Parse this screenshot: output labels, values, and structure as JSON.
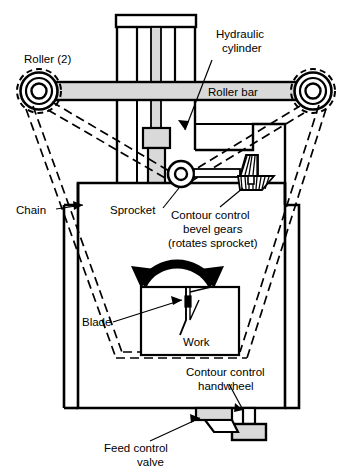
{
  "figure": {
    "type": "technical-line-diagram",
    "background_color": "#ffffff",
    "line_color": "#000000",
    "fill_gray": "#d9d9d9",
    "fill_white": "#ffffff"
  },
  "labels": {
    "roller": "Roller (2)",
    "hydraulic_cylinder_line1": "Hydraulic",
    "hydraulic_cylinder_line2": "cylinder",
    "roller_bar": "Roller bar",
    "chain": "Chain",
    "sprocket": "Sprocket",
    "bevel_gears_line1": "Contour control",
    "bevel_gears_line2": "bevel gears",
    "bevel_gears_line3": "(rotates sprocket)",
    "blade": "Blade",
    "work": "Work",
    "handwheel_line1": "Contour control",
    "handwheel_line2": "handwheel",
    "feed_valve_line1": "Feed control",
    "feed_valve_line2": "valve"
  },
  "parts": [
    {
      "name": "roller-left",
      "label": "Roller (2)",
      "shape": "concentric-circles"
    },
    {
      "name": "roller-right",
      "label": "Roller (2)",
      "shape": "concentric-circles"
    },
    {
      "name": "roller-bar",
      "label": "Roller bar",
      "shape": "horizontal-bar"
    },
    {
      "name": "hydraulic-cylinder",
      "label": "Hydraulic cylinder",
      "shape": "vertical-cylinder"
    },
    {
      "name": "chain",
      "label": "Chain",
      "shape": "double-line-loop"
    },
    {
      "name": "sprocket",
      "label": "Sprocket",
      "shape": "toothed-wheel"
    },
    {
      "name": "bevel-gears",
      "label": "Contour control bevel gears (rotates sprocket)",
      "shape": "bevel-gear-pair"
    },
    {
      "name": "blade",
      "label": "Blade",
      "shape": "thin-vertical-blade"
    },
    {
      "name": "work",
      "label": "Work",
      "shape": "square-block"
    },
    {
      "name": "handwheel",
      "label": "Contour control handwheel",
      "shape": "stem-block"
    },
    {
      "name": "feed-valve",
      "label": "Feed control valve",
      "shape": "valve-with-handle"
    },
    {
      "name": "swivel-arrow",
      "label": "rotation indicator",
      "shape": "double-headed-arc-arrow"
    }
  ]
}
